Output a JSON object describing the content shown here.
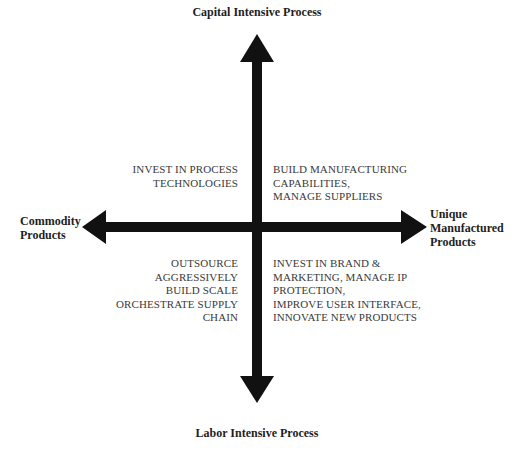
{
  "diagram": {
    "type": "2x2 quadrant matrix",
    "axes": {
      "vertical": {
        "top_label": "Capital Intensive Process",
        "bottom_label": "Labor Intensive Process"
      },
      "horizontal": {
        "left_label": [
          "Commodity",
          "Products"
        ],
        "right_label": [
          "Unique",
          "Manufactured",
          "Products"
        ]
      }
    },
    "quadrants": {
      "top_left": {
        "lines": [
          "INVEST IN PROCESS",
          "TECHNOLOGIES"
        ]
      },
      "top_right": {
        "lines": [
          "BUILD MANUFACTURING",
          "CAPABILITIES,",
          "MANAGE SUPPLIERS"
        ]
      },
      "bottom_left": {
        "lines": [
          "OUTSOURCE",
          "AGGRESSIVELY",
          "BUILD SCALE",
          "ORCHESTRATE SUPPLY",
          "CHAIN"
        ]
      },
      "bottom_right": {
        "lines": [
          "INVEST IN BRAND &",
          "MARKETING, MANAGE IP",
          "PROTECTION,",
          "IMPROVE USER INTERFACE,",
          "INNOVATE NEW PRODUCTS"
        ]
      }
    },
    "colors": {
      "arrow": "#111111",
      "label": "#1e1e1e",
      "quadrant_text": "#3a3a3a",
      "background": "#ffffff"
    }
  }
}
